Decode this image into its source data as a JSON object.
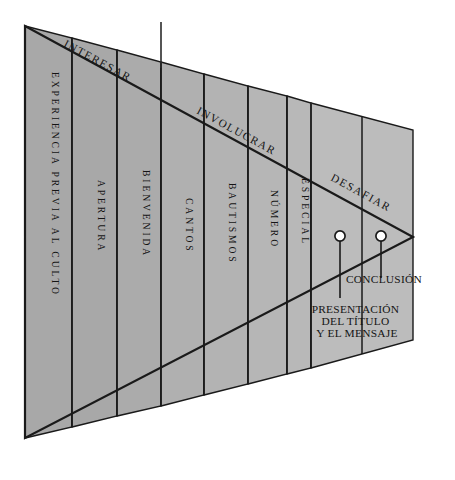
{
  "diagram": {
    "type": "funnel-triangle",
    "colors": {
      "stroke": "#1a1a1a",
      "text": "#141414",
      "background": "#ffffff",
      "band_fills": [
        "#a8a8a8",
        "#a8a8a8",
        "#ababab",
        "#b0b0b0",
        "#b3b3b3",
        "#b6b6b6",
        "#b8b8b8",
        "#bcbcbc"
      ]
    },
    "phases": [
      {
        "label": "INTERESAR"
      },
      {
        "label": "INVOLUCRAR"
      },
      {
        "label": "DESAFIAR"
      }
    ],
    "bands": [
      {
        "label": "EXPERIENCIA PREVIA AL CULTO"
      },
      {
        "label": "APERTURA"
      },
      {
        "label": "BIENVENIDA"
      },
      {
        "label": "CANTOS"
      },
      {
        "label": "BAUTISMOS"
      },
      {
        "label": "NÚMERO"
      },
      {
        "label": "ESPECIAL"
      }
    ],
    "callouts": [
      {
        "label_lines": [
          "PRESENTACIÓN",
          "DEL TÍTULO",
          "Y EL MENSAJE"
        ]
      },
      {
        "label_lines": [
          "CONCLUSIÓN"
        ]
      }
    ]
  }
}
